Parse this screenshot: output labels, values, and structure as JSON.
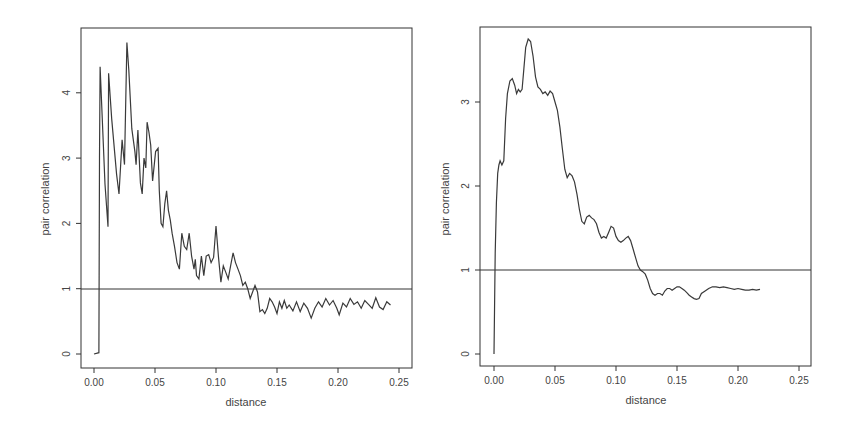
{
  "chart_data": [
    {
      "type": "line",
      "title": "",
      "xlabel": "distance",
      "ylabel": "pair correlation",
      "xlim": [
        -0.01,
        0.26
      ],
      "ylim": [
        -0.2,
        5.0
      ],
      "xticks": [
        "0.00",
        "0.05",
        "0.10",
        "0.15",
        "0.20",
        "0.25"
      ],
      "yticks": [
        "0",
        "1",
        "2",
        "3",
        "4"
      ],
      "reference_line": 1,
      "grid": false,
      "legend": null,
      "series": [
        {
          "name": "g(r)",
          "x": [
            0.0,
            0.004,
            0.0045,
            0.005,
            0.009,
            0.0115,
            0.012,
            0.0145,
            0.0185,
            0.0205,
            0.023,
            0.025,
            0.027,
            0.0285,
            0.031,
            0.0335,
            0.0345,
            0.036,
            0.038,
            0.0395,
            0.041,
            0.0425,
            0.0435,
            0.045,
            0.0465,
            0.048,
            0.0505,
            0.0525,
            0.0535,
            0.055,
            0.0565,
            0.058,
            0.0595,
            0.061,
            0.0625,
            0.064,
            0.066,
            0.068,
            0.07,
            0.072,
            0.074,
            0.076,
            0.078,
            0.08,
            0.082,
            0.083,
            0.084,
            0.086,
            0.088,
            0.09,
            0.092,
            0.094,
            0.096,
            0.098,
            0.1,
            0.102,
            0.104,
            0.106,
            0.108,
            0.11,
            0.112,
            0.114,
            0.116,
            0.118,
            0.12,
            0.122,
            0.124,
            0.126,
            0.128,
            0.13,
            0.132,
            0.134,
            0.136,
            0.138,
            0.14,
            0.142,
            0.144,
            0.146,
            0.148,
            0.15,
            0.152,
            0.154,
            0.156,
            0.158,
            0.16,
            0.163,
            0.166,
            0.169,
            0.172,
            0.175,
            0.178,
            0.181,
            0.184,
            0.187,
            0.19,
            0.193,
            0.196,
            0.199,
            0.201,
            0.204,
            0.207,
            0.21,
            0.213,
            0.216,
            0.219,
            0.222,
            0.225,
            0.228,
            0.231,
            0.234,
            0.237,
            0.24,
            0.243,
            0.246,
            0.248
          ],
          "y": [
            0.0,
            0.02,
            3.0,
            4.4,
            2.6,
            1.95,
            4.3,
            3.6,
            2.75,
            2.45,
            3.28,
            2.9,
            4.77,
            4.35,
            3.45,
            3.1,
            2.9,
            3.43,
            2.62,
            2.45,
            3.0,
            2.85,
            3.55,
            3.4,
            3.2,
            2.65,
            3.1,
            3.15,
            2.5,
            2.0,
            1.95,
            2.3,
            2.5,
            2.2,
            2.05,
            1.85,
            1.65,
            1.4,
            1.3,
            1.85,
            1.65,
            1.6,
            1.85,
            1.5,
            1.3,
            1.45,
            1.2,
            1.15,
            1.5,
            1.2,
            1.5,
            1.52,
            1.4,
            1.48,
            1.96,
            1.5,
            1.1,
            1.35,
            1.25,
            1.15,
            1.35,
            1.55,
            1.4,
            1.3,
            1.2,
            1.05,
            1.1,
            1.0,
            0.85,
            0.95,
            1.05,
            0.95,
            0.65,
            0.68,
            0.62,
            0.7,
            0.85,
            0.8,
            0.72,
            0.62,
            0.8,
            0.7,
            0.82,
            0.7,
            0.75,
            0.66,
            0.8,
            0.65,
            0.78,
            0.7,
            0.55,
            0.7,
            0.8,
            0.72,
            0.85,
            0.75,
            0.82,
            0.7,
            0.6,
            0.78,
            0.72,
            0.85,
            0.76,
            0.8,
            0.7,
            0.82,
            0.76,
            0.7,
            0.86,
            0.72,
            0.68,
            0.8,
            0.75
          ]
        }
      ]
    },
    {
      "type": "line",
      "title": "",
      "xlabel": "distance",
      "ylabel": "pair correlation",
      "xlim": [
        -0.01,
        0.26
      ],
      "ylim": [
        -0.1,
        3.9
      ],
      "xticks": [
        "0.00",
        "0.05",
        "0.10",
        "0.15",
        "0.20",
        "0.25"
      ],
      "yticks": [
        "0",
        "1",
        "2",
        "3"
      ],
      "reference_line": 1,
      "grid": false,
      "legend": null,
      "series": [
        {
          "name": "g(r) smoothed",
          "x": [
            0.0,
            0.0005,
            0.001,
            0.002,
            0.003,
            0.004,
            0.005,
            0.0065,
            0.008,
            0.0095,
            0.011,
            0.013,
            0.015,
            0.017,
            0.0185,
            0.02,
            0.0215,
            0.023,
            0.0245,
            0.026,
            0.028,
            0.03,
            0.032,
            0.034,
            0.036,
            0.038,
            0.04,
            0.042,
            0.044,
            0.046,
            0.048,
            0.05,
            0.052,
            0.054,
            0.056,
            0.058,
            0.06,
            0.062,
            0.064,
            0.066,
            0.068,
            0.07,
            0.072,
            0.074,
            0.076,
            0.078,
            0.08,
            0.082,
            0.084,
            0.086,
            0.088,
            0.09,
            0.092,
            0.094,
            0.096,
            0.098,
            0.1,
            0.102,
            0.104,
            0.106,
            0.108,
            0.11,
            0.112,
            0.114,
            0.116,
            0.118,
            0.12,
            0.122,
            0.124,
            0.126,
            0.128,
            0.13,
            0.132,
            0.134,
            0.136,
            0.138,
            0.14,
            0.142,
            0.144,
            0.146,
            0.148,
            0.15,
            0.152,
            0.154,
            0.156,
            0.158,
            0.16,
            0.162,
            0.164,
            0.166,
            0.168,
            0.17,
            0.173,
            0.176,
            0.179,
            0.182,
            0.185,
            0.188,
            0.191,
            0.194,
            0.197,
            0.2,
            0.203,
            0.206,
            0.209,
            0.212,
            0.215,
            0.218,
            0.221,
            0.224,
            0.227,
            0.23,
            0.233,
            0.236,
            0.239,
            0.242,
            0.245,
            0.248
          ],
          "y": [
            0.0,
            0.6,
            1.2,
            1.8,
            2.15,
            2.25,
            2.3,
            2.25,
            2.3,
            2.8,
            3.1,
            3.25,
            3.28,
            3.2,
            3.1,
            3.15,
            3.12,
            3.15,
            3.4,
            3.65,
            3.75,
            3.72,
            3.55,
            3.3,
            3.18,
            3.15,
            3.1,
            3.12,
            3.08,
            3.13,
            3.1,
            3.0,
            2.9,
            2.7,
            2.45,
            2.2,
            2.1,
            2.15,
            2.12,
            2.05,
            1.9,
            1.72,
            1.58,
            1.55,
            1.63,
            1.65,
            1.62,
            1.6,
            1.55,
            1.45,
            1.38,
            1.4,
            1.38,
            1.45,
            1.52,
            1.5,
            1.4,
            1.35,
            1.33,
            1.35,
            1.38,
            1.4,
            1.35,
            1.25,
            1.15,
            1.05,
            1.0,
            0.98,
            0.95,
            0.88,
            0.78,
            0.72,
            0.7,
            0.72,
            0.72,
            0.7,
            0.75,
            0.78,
            0.78,
            0.76,
            0.78,
            0.8,
            0.8,
            0.78,
            0.76,
            0.73,
            0.7,
            0.68,
            0.66,
            0.65,
            0.66,
            0.72,
            0.75,
            0.78,
            0.8,
            0.8,
            0.79,
            0.8,
            0.79,
            0.78,
            0.77,
            0.78,
            0.77,
            0.76,
            0.76,
            0.77,
            0.76,
            0.77
          ]
        }
      ]
    }
  ]
}
